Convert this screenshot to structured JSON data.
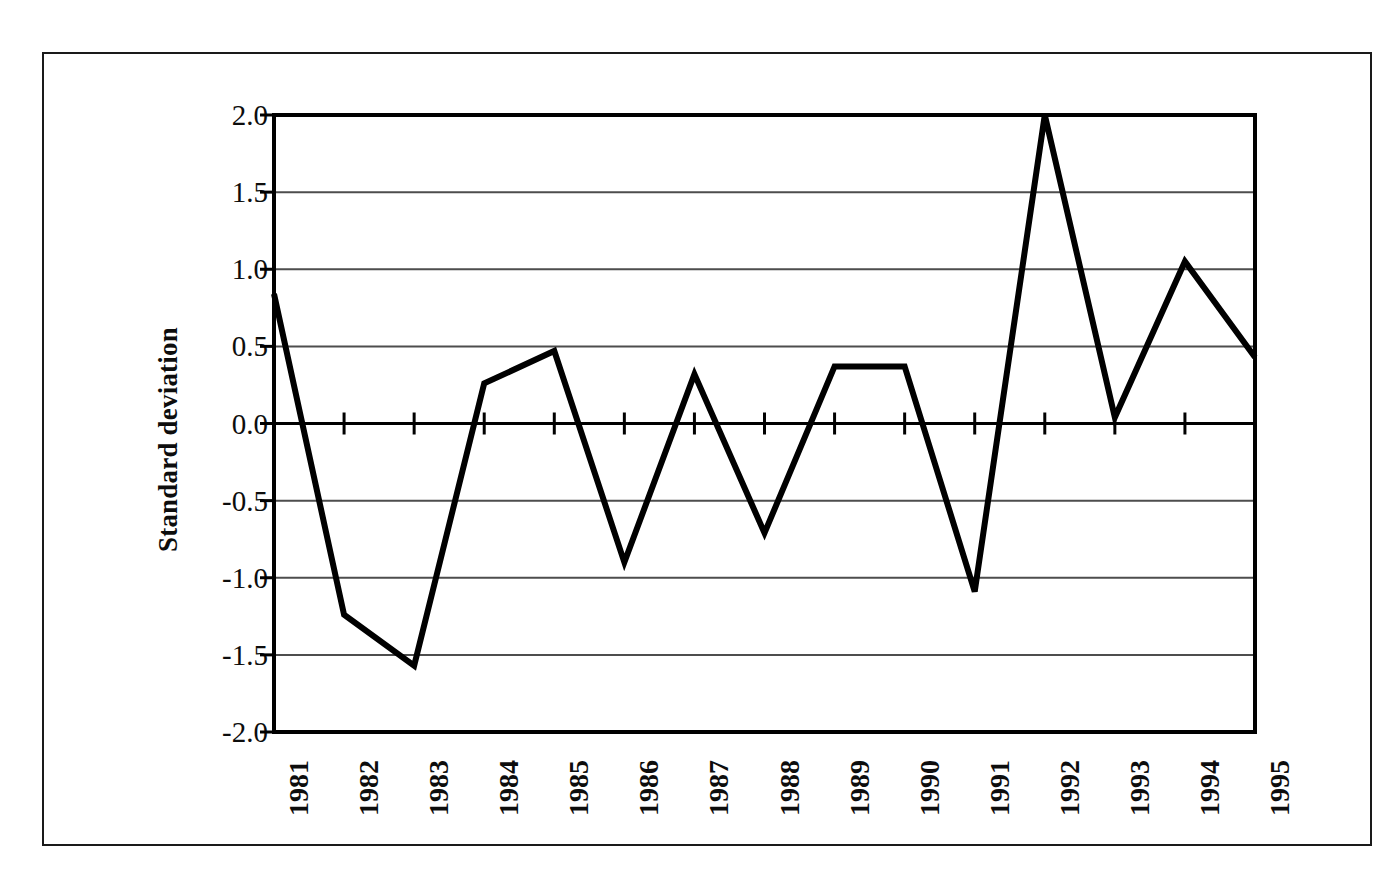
{
  "chart_data": {
    "type": "line",
    "title": "",
    "subtitle": "",
    "xlabel": "",
    "ylabel": "Standard deviation",
    "x": [
      "1981",
      "1982",
      "1983",
      "1984",
      "1985",
      "1986",
      "1987",
      "1988",
      "1989",
      "1990",
      "1991",
      "1992",
      "1993",
      "1994",
      "1995"
    ],
    "categories": [
      "1981",
      "1982",
      "1983",
      "1984",
      "1985",
      "1986",
      "1987",
      "1988",
      "1989",
      "1990",
      "1991",
      "1992",
      "1993",
      "1994",
      "1995"
    ],
    "values": [
      0.84,
      -1.24,
      -1.57,
      0.26,
      0.47,
      -0.9,
      0.32,
      -0.71,
      0.37,
      0.37,
      -1.09,
      2.0,
      0.04,
      1.05,
      0.43
    ],
    "series": [
      {
        "name": "Standard deviation",
        "values": [
          0.84,
          -1.24,
          -1.57,
          0.26,
          0.47,
          -0.9,
          0.32,
          -0.71,
          0.37,
          0.37,
          -1.09,
          2.0,
          0.04,
          1.05,
          0.43
        ],
        "color": "#000000",
        "line_width": 6
      }
    ],
    "ylim": [
      -2.0,
      2.0
    ],
    "yticks": [
      2.0,
      1.5,
      1.0,
      0.5,
      0.0,
      -0.5,
      -1.0,
      -1.5,
      -2.0
    ],
    "ytick_labels": [
      "2.0",
      "1.5",
      "1.0",
      "0.5",
      "0.0",
      "-0.5",
      "-1.0",
      "-1.5",
      "-2.0"
    ],
    "xtick_labels": [
      "1981",
      "1982",
      "1983",
      "1984",
      "1985",
      "1986",
      "1987",
      "1988",
      "1989",
      "1990",
      "1991",
      "1992",
      "1993",
      "1994",
      "1995"
    ],
    "xtick_rotation_deg": 90,
    "grid": true,
    "grid_axis": "y",
    "grid_color": "#4d4d4d",
    "legend": false,
    "legend_position": "none",
    "plot_border": true,
    "plot_border_color": "#000000",
    "background_color": "#ffffff",
    "zero_line": 0.0,
    "zero_line_ticks": true,
    "annotations": []
  },
  "figure": {
    "outer_frame_color": "#1a1a1a",
    "axis_title_y": "Standard deviation"
  }
}
